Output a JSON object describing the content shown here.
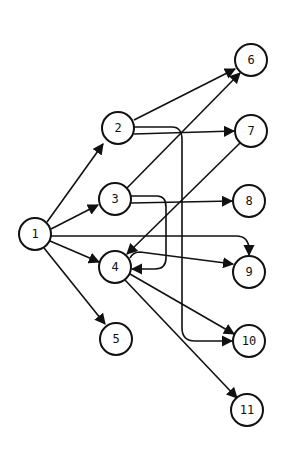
{
  "diagram": {
    "type": "directed-graph",
    "node_radius": 16,
    "colors": {
      "stroke": "#111111",
      "background": "#ffffff"
    },
    "nodes": [
      {
        "id": "1",
        "label": "1",
        "x": 35,
        "y": 234
      },
      {
        "id": "2",
        "label": "2",
        "x": 118,
        "y": 128
      },
      {
        "id": "3",
        "label": "3",
        "x": 115,
        "y": 199
      },
      {
        "id": "4",
        "label": "4",
        "x": 115,
        "y": 267
      },
      {
        "id": "5",
        "label": "5",
        "x": 116,
        "y": 339
      },
      {
        "id": "6",
        "label": "6",
        "x": 251,
        "y": 60
      },
      {
        "id": "7",
        "label": "7",
        "x": 251,
        "y": 131
      },
      {
        "id": "8",
        "label": "8",
        "x": 249,
        "y": 201
      },
      {
        "id": "9",
        "label": "9",
        "x": 249,
        "y": 272
      },
      {
        "id": "10",
        "label": "10",
        "x": 249,
        "y": 341
      },
      {
        "id": "11",
        "label": "11",
        "x": 247,
        "y": 410
      }
    ],
    "edges": [
      {
        "from": "1",
        "to": "2",
        "path": "M47 222 L103 144"
      },
      {
        "from": "1",
        "to": "3",
        "path": "M51 229 L98 205"
      },
      {
        "from": "1",
        "to": "4",
        "path": "M50 241 L99 262"
      },
      {
        "from": "1",
        "to": "5",
        "path": "M44 248 L105 324"
      },
      {
        "from": "1",
        "to": "9",
        "path": "M51 236 L236 236 Q249 236 249 250 L249 255"
      },
      {
        "from": "2",
        "to": "6",
        "path": "M134 120 L235 69"
      },
      {
        "from": "2",
        "to": "7",
        "path": "M134 134 L234 131"
      },
      {
        "from": "2",
        "to": "10",
        "path": "M134 127 L172 127 Q182 127 182 140 L182 328 Q182 341 195 341 L232 341"
      },
      {
        "from": "3",
        "to": "6",
        "path": "M127 188 L240 73"
      },
      {
        "from": "3",
        "to": "8",
        "path": "M131 203 L232 201"
      },
      {
        "from": "3",
        "to": "4",
        "path": "M131 196 L157 196 Q166 196 166 207 L166 258 Q166 269 155 269 L132 269"
      },
      {
        "from": "7",
        "to": "4",
        "path": "M240 143 L127 254"
      },
      {
        "from": "4",
        "to": "9",
        "path": "M130 258 Q133 252 140 252 L233 264"
      },
      {
        "from": "4",
        "to": "10",
        "path": "M130 274 L234 334"
      },
      {
        "from": "4",
        "to": "11",
        "path": "M125 280 L237 398"
      }
    ]
  }
}
